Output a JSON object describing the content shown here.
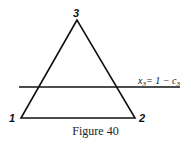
{
  "figure": {
    "caption": "Figure 40",
    "vertices": [
      {
        "label": "3",
        "x": 77,
        "y": 20
      },
      {
        "label": "1",
        "x": 21,
        "y": 118
      },
      {
        "label": "2",
        "x": 135,
        "y": 118
      }
    ],
    "line": {
      "label_var": "x",
      "label_sub": "3",
      "label_rhs": "= 1 − c",
      "label_rhs_sub": "3",
      "y": 87
    }
  }
}
